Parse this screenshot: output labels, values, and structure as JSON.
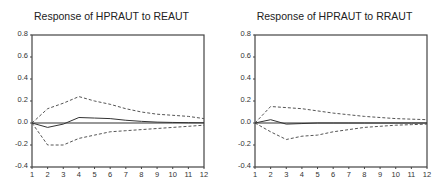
{
  "chart_data": [
    {
      "type": "line",
      "title": "Response of HPRAUT to REAUT",
      "xlabel": "",
      "ylabel": "",
      "x": [
        1,
        2,
        3,
        4,
        5,
        6,
        7,
        8,
        9,
        10,
        11,
        12
      ],
      "ylim": [
        -0.4,
        0.8
      ],
      "yticks": [
        "0.8",
        "0.6",
        "0.4",
        "0.2",
        "0.0",
        "-0.2",
        "-0.4"
      ],
      "xticks": [
        "1",
        "2",
        "3",
        "4",
        "5",
        "6",
        "7",
        "8",
        "9",
        "10",
        "11",
        "12"
      ],
      "grid": false,
      "legend": "none",
      "series": [
        {
          "name": "Response",
          "style": "solid",
          "values": [
            0.0,
            -0.04,
            -0.01,
            0.05,
            0.045,
            0.04,
            0.025,
            0.015,
            0.008,
            0.005,
            0.003,
            0.002
          ]
        },
        {
          "name": "Upper band (+2 S.E.)",
          "style": "dashed",
          "values": [
            0.0,
            0.13,
            0.18,
            0.24,
            0.2,
            0.17,
            0.13,
            0.1,
            0.08,
            0.07,
            0.06,
            0.04
          ]
        },
        {
          "name": "Lower band (-2 S.E.)",
          "style": "dashed",
          "values": [
            0.0,
            -0.2,
            -0.2,
            -0.14,
            -0.11,
            -0.08,
            -0.07,
            -0.06,
            -0.05,
            -0.04,
            -0.03,
            -0.02
          ]
        },
        {
          "name": "Zero line",
          "style": "solid",
          "values": [
            0,
            0,
            0,
            0,
            0,
            0,
            0,
            0,
            0,
            0,
            0,
            0
          ]
        }
      ]
    },
    {
      "type": "line",
      "title": "Response of HPRAUT to RRAUT",
      "xlabel": "",
      "ylabel": "",
      "x": [
        1,
        2,
        3,
        4,
        5,
        6,
        7,
        8,
        9,
        10,
        11,
        12
      ],
      "ylim": [
        -0.4,
        0.8
      ],
      "yticks": [
        "0.8",
        "0.6",
        "0.4",
        "0.2",
        "0.0",
        "-0.2",
        "-0.4"
      ],
      "xticks": [
        "1",
        "2",
        "3",
        "4",
        "5",
        "6",
        "7",
        "8",
        "9",
        "10",
        "11",
        "12"
      ],
      "grid": false,
      "legend": "none",
      "series": [
        {
          "name": "Response",
          "style": "solid",
          "values": [
            0.0,
            0.03,
            -0.01,
            -0.005,
            0.0,
            0.0,
            0.0,
            0.0,
            0.0,
            0.0,
            0.0,
            0.0
          ]
        },
        {
          "name": "Upper band (+2 S.E.)",
          "style": "dashed",
          "values": [
            0.0,
            0.15,
            0.14,
            0.13,
            0.11,
            0.09,
            0.075,
            0.06,
            0.05,
            0.04,
            0.035,
            0.03
          ]
        },
        {
          "name": "Lower band (-2 S.E.)",
          "style": "dashed",
          "values": [
            0.0,
            -0.08,
            -0.15,
            -0.12,
            -0.11,
            -0.08,
            -0.06,
            -0.04,
            -0.03,
            -0.02,
            -0.015,
            -0.01
          ]
        },
        {
          "name": "Zero line",
          "style": "solid",
          "values": [
            0,
            0,
            0,
            0,
            0,
            0,
            0,
            0,
            0,
            0,
            0,
            0
          ]
        }
      ]
    }
  ]
}
